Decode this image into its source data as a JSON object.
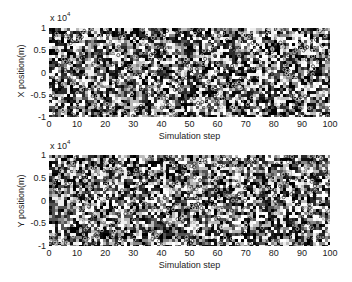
{
  "chart_data": [
    {
      "type": "scatter",
      "title": "",
      "xlabel": "Simulation step",
      "ylabel": "X position(m)",
      "y_scale_note": "x 10^4",
      "xlim": [
        0,
        100
      ],
      "ylim": [
        -1,
        1
      ],
      "x_ticks": [
        "0",
        "10",
        "20",
        "30",
        "40",
        "50",
        "60",
        "70",
        "80",
        "90",
        "100"
      ],
      "y_ticks": [
        "1",
        "0.5",
        "0",
        "-0.5",
        "-1"
      ],
      "grid": false,
      "legend": null,
      "description": "Dense cloud of particle positions uniformly spread over [-1e4, 1e4] at every simulation step 0-100"
    },
    {
      "type": "scatter",
      "title": "",
      "xlabel": "Simulation step",
      "ylabel": "Y position(m)",
      "y_scale_note": "x 10^4",
      "xlim": [
        0,
        100
      ],
      "ylim": [
        -1,
        1
      ],
      "x_ticks": [
        "0",
        "10",
        "20",
        "30",
        "40",
        "50",
        "60",
        "70",
        "80",
        "90",
        "100"
      ],
      "y_ticks": [
        "1",
        "0.5",
        "0",
        "-0.5",
        "-1"
      ],
      "grid": false,
      "legend": null,
      "description": "Dense cloud of particle positions uniformly spread over [-1e4, 1e4] at every simulation step 0-100"
    }
  ],
  "top": {
    "ylabel": "X position(m)",
    "xlabel": "Simulation step",
    "exp_base": "x 10",
    "exp_pow": "4"
  },
  "bottom": {
    "ylabel": "Y position(m)",
    "xlabel": "Simulation step",
    "exp_base": "x 10",
    "exp_pow": "4"
  }
}
